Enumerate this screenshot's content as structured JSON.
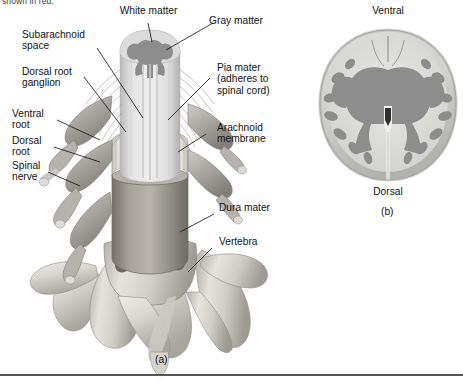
{
  "figure": {
    "partial_top_text": "shown in red.",
    "panels": [
      {
        "id": "a",
        "caption": "(a)"
      },
      {
        "id": "b",
        "caption": "(b)"
      }
    ]
  },
  "labels": {
    "white_matter": "White matter",
    "gray_matter": "Gray matter",
    "subarachnoid_space": "Subarachnoid\nspace",
    "dorsal_root_ganglion": "Dorsal root\nganglion",
    "ventral_root": "Ventral\nroot",
    "dorsal_root": "Dorsal\nroot",
    "spinal_nerve": "Spinal\nnerve",
    "pia_mater": "Pia mater\n(adheres to\nspinal cord)",
    "arachnoid_membrane": "Arachnoid\nmembrane",
    "dura_mater": "Dura mater",
    "vertebra": "Vertebra",
    "ventral": "Ventral",
    "dorsal": "Dorsal"
  },
  "colors": {
    "background": "#ffffff",
    "text": "#121212",
    "leader_line": "#1a1a1a",
    "gray_matter": "#8d8d8d",
    "white_matter": "#d8d8d8",
    "bone_light": "#e2e0dd",
    "bone_mid": "#c4c1bc",
    "bone_dark": "#9c9892",
    "dura": "#8f8b86",
    "nerve": "#aaa6a1",
    "rule": "#555555"
  }
}
